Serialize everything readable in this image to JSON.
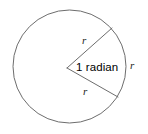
{
  "figure": {
    "background_color": "#ffffff",
    "stroke_color": "#6d6d6d",
    "text_color": "#000000",
    "width": 148,
    "height": 134
  },
  "circle": {
    "center_x": 69.5,
    "center_y": 66.5,
    "radius": 56.5
  },
  "angle": {
    "vertex_x": 67,
    "vertex_y": 68,
    "measure_label": "1 radian",
    "measure_value": 1,
    "measure_unit": "radian"
  },
  "radii": [
    {
      "name": "upper-radius",
      "label": "r",
      "from_x": 67,
      "from_y": 68,
      "to_x": 112,
      "to_y": 28,
      "label_x": 82,
      "label_y": 35
    },
    {
      "name": "lower-radius",
      "label": "r",
      "from_x": 67,
      "from_y": 68,
      "to_x": 118,
      "to_y": 97,
      "label_x": 83,
      "label_y": 86
    }
  ],
  "arc_label": {
    "name": "arc-length-label",
    "label": "r",
    "label_x": 130,
    "label_y": 60
  }
}
